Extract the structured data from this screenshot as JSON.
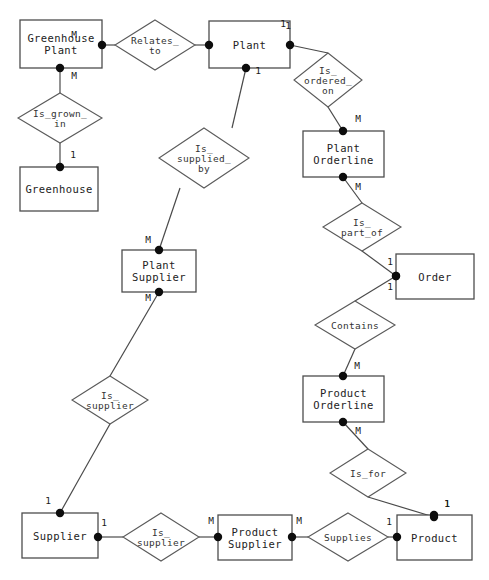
{
  "diagram": {
    "width": 489,
    "height": 580,
    "notation": "Chen",
    "colors": {
      "background": "#ffffff",
      "entity_stroke": "#4d4d4d",
      "relationship_stroke": "#5a5a5a",
      "line": "#4a4a4a",
      "dot": "#0d0d0d",
      "text": "#222222"
    }
  },
  "entities": [
    {
      "id": "greenhouse_plant",
      "label": "Greenhouse\nPlant",
      "lines": [
        "Greenhouse",
        "Plant"
      ],
      "x": 20,
      "y": 20,
      "w": 82,
      "h": 48
    },
    {
      "id": "plant",
      "label": "Plant",
      "lines": [
        "Plant"
      ],
      "x": 209,
      "y": 21,
      "w": 81,
      "h": 47
    },
    {
      "id": "greenhouse",
      "label": "Greenhouse",
      "lines": [
        "Greenhouse"
      ],
      "x": 20,
      "y": 167,
      "w": 78,
      "h": 44
    },
    {
      "id": "plant_orderline",
      "label": "Plant\nOrderline",
      "lines": [
        "Plant",
        "Orderline"
      ],
      "x": 303,
      "y": 131,
      "w": 81,
      "h": 46
    },
    {
      "id": "plant_supplier",
      "label": "Plant\nSupplier",
      "lines": [
        "Plant",
        "Supplier"
      ],
      "x": 122,
      "y": 250,
      "w": 74,
      "h": 42
    },
    {
      "id": "order",
      "label": "Order",
      "lines": [
        "Order"
      ],
      "x": 396,
      "y": 254,
      "w": 78,
      "h": 45
    },
    {
      "id": "product_orderline",
      "label": "Product\nOrderline",
      "lines": [
        "Product",
        "Orderline"
      ],
      "x": 303,
      "y": 376,
      "w": 81,
      "h": 46
    },
    {
      "id": "supplier",
      "label": "Supplier",
      "lines": [
        "Supplier"
      ],
      "x": 22,
      "y": 513,
      "w": 76,
      "h": 45
    },
    {
      "id": "product_supplier",
      "label": "Product\nSupplier",
      "lines": [
        "Product",
        "Supplier"
      ],
      "x": 218,
      "y": 515,
      "w": 74,
      "h": 45
    },
    {
      "id": "product",
      "label": "Product",
      "lines": [
        "Product"
      ],
      "x": 397,
      "y": 515,
      "w": 75,
      "h": 45
    }
  ],
  "relationships": [
    {
      "id": "relates_to",
      "label": "Relates_to",
      "lines": [
        "Relates_",
        "to"
      ],
      "cx": 155,
      "cy": 45,
      "rx": 40,
      "ry": 25
    },
    {
      "id": "is_grown_in",
      "label": "Is_grown_in",
      "lines": [
        "Is_grown_",
        "in"
      ],
      "cx": 60,
      "cy": 118,
      "rx": 42,
      "ry": 25
    },
    {
      "id": "is_supplied_by",
      "label": "Is_supplied_by",
      "lines": [
        "Is_",
        "supplied_",
        "by"
      ],
      "cx": 204,
      "cy": 158,
      "rx": 45,
      "ry": 30
    },
    {
      "id": "is_ordered_on",
      "label": "Is_ordered_on",
      "lines": [
        "Is_",
        "ordered_",
        "on"
      ],
      "cx": 328,
      "cy": 80,
      "rx": 34,
      "ry": 27
    },
    {
      "id": "is_part_of",
      "label": "Is_part_of",
      "lines": [
        "Is_",
        "part_of"
      ],
      "cx": 362,
      "cy": 227,
      "rx": 39,
      "ry": 24
    },
    {
      "id": "contains",
      "label": "Contains",
      "lines": [
        "Contains"
      ],
      "cx": 355,
      "cy": 325,
      "rx": 40,
      "ry": 24
    },
    {
      "id": "is_supplier_plant",
      "label": "Is_supplier",
      "lines": [
        "Is_",
        "supplier"
      ],
      "cx": 110,
      "cy": 400,
      "rx": 38,
      "ry": 24
    },
    {
      "id": "is_for",
      "label": "Is_for",
      "lines": [
        "Is_for"
      ],
      "cx": 368,
      "cy": 473,
      "rx": 38,
      "ry": 24
    },
    {
      "id": "is_supplier_product",
      "label": "Is_supplier",
      "lines": [
        "Is_",
        "supplier"
      ],
      "cx": 161,
      "cy": 537,
      "rx": 38,
      "ry": 24
    },
    {
      "id": "supplies",
      "label": "Supplies",
      "lines": [
        "Supplies"
      ],
      "cx": 348,
      "cy": 537,
      "rx": 40,
      "ry": 24
    }
  ],
  "connections": [
    {
      "id": "c-ghplant-relates",
      "from": "greenhouse_plant",
      "to": "relates_to",
      "points": [
        [
          102,
          45
        ],
        [
          115,
          45
        ]
      ],
      "dot": [
        102,
        45
      ],
      "cardinality": "M",
      "cardinality_pos": [
        74,
        38
      ]
    },
    {
      "id": "c-relates-plant",
      "from": "relates_to",
      "to": "plant",
      "points": [
        [
          195,
          45
        ],
        [
          209,
          45
        ]
      ],
      "dot": [
        209,
        45
      ],
      "cardinality": "1",
      "cardinality_pos": [
        283,
        27
      ]
    },
    {
      "id": "c-ghplant-grown",
      "from": "greenhouse_plant",
      "to": "is_grown_in",
      "points": [
        [
          60,
          68
        ],
        [
          60,
          93
        ]
      ],
      "dot": [
        60,
        68
      ],
      "cardinality": "M",
      "cardinality_pos": [
        74,
        79
      ]
    },
    {
      "id": "c-grown-greenhouse",
      "from": "is_grown_in",
      "to": "greenhouse",
      "points": [
        [
          60,
          143
        ],
        [
          60,
          167
        ]
      ],
      "dot": [
        60,
        167
      ],
      "cardinality": "1",
      "cardinality_pos": [
        73,
        158
      ]
    },
    {
      "id": "c-plant-supplied",
      "from": "plant",
      "to": "is_supplied_by",
      "points": [
        [
          246,
          68
        ],
        [
          232,
          128
        ]
      ],
      "dot": [
        246,
        68
      ],
      "cardinality": "1",
      "cardinality_pos": [
        258,
        74
      ]
    },
    {
      "id": "c-supplied-plantsupplier",
      "from": "is_supplied_by",
      "to": "plant_supplier",
      "points": [
        [
          180,
          188
        ],
        [
          159,
          250
        ]
      ],
      "dot": [
        159,
        250
      ],
      "cardinality": "M",
      "cardinality_pos": [
        148,
        243
      ]
    },
    {
      "id": "c-plant-ordered",
      "from": "plant",
      "to": "is_ordered_on",
      "points": [
        [
          290,
          45
        ],
        [
          328,
          53
        ]
      ],
      "dot": [
        290,
        45
      ],
      "cardinality": "1",
      "cardinality_pos": [
        288,
        29
      ]
    },
    {
      "id": "c-ordered-plantorderline",
      "from": "is_ordered_on",
      "to": "plant_orderline",
      "points": [
        [
          328,
          107
        ],
        [
          343,
          131
        ]
      ],
      "dot": [
        343,
        131
      ],
      "cardinality": "M",
      "cardinality_pos": [
        358,
        122
      ]
    },
    {
      "id": "c-plantorderline-partof",
      "from": "plant_orderline",
      "to": "is_part_of",
      "points": [
        [
          343,
          177
        ],
        [
          362,
          203
        ]
      ],
      "dot": [
        343,
        177
      ],
      "cardinality": "M",
      "cardinality_pos": [
        358,
        190
      ]
    },
    {
      "id": "c-partof-order",
      "from": "is_part_of",
      "to": "order",
      "points": [
        [
          362,
          251
        ],
        [
          396,
          276
        ]
      ],
      "dot": [
        396,
        276
      ],
      "cardinality": "1",
      "cardinality_pos": [
        390,
        265
      ]
    },
    {
      "id": "c-order-contains",
      "from": "order",
      "to": "contains",
      "points": [
        [
          396,
          276
        ],
        [
          355,
          301
        ]
      ],
      "dot": [
        396,
        276
      ],
      "cardinality": "1",
      "cardinality_pos": [
        390,
        290
      ]
    },
    {
      "id": "c-contains-productorderline",
      "from": "contains",
      "to": "product_orderline",
      "points": [
        [
          355,
          349
        ],
        [
          343,
          376
        ]
      ],
      "dot": [
        343,
        376
      ],
      "cardinality": "M",
      "cardinality_pos": [
        357,
        369
      ]
    },
    {
      "id": "c-productorderline-isfor",
      "from": "product_orderline",
      "to": "is_for",
      "points": [
        [
          343,
          422
        ],
        [
          368,
          449
        ]
      ],
      "dot": [
        343,
        422
      ],
      "cardinality": "M",
      "cardinality_pos": [
        358,
        434
      ]
    },
    {
      "id": "c-isfor-product",
      "from": "is_for",
      "to": "product",
      "points": [
        [
          368,
          497
        ],
        [
          434,
          517
        ]
      ],
      "dot": [
        434,
        517
      ],
      "cardinality": "1",
      "cardinality_pos": [
        447,
        507
      ]
    },
    {
      "id": "c-plantsupplier-issupplier",
      "from": "plant_supplier",
      "to": "is_supplier_plant",
      "points": [
        [
          159,
          292
        ],
        [
          110,
          376
        ]
      ],
      "dot": [
        159,
        292
      ],
      "cardinality": "M",
      "cardinality_pos": [
        148,
        301
      ]
    },
    {
      "id": "c-issupplier-supplier",
      "from": "is_supplier_plant",
      "to": "supplier",
      "points": [
        [
          110,
          424
        ],
        [
          60,
          513
        ]
      ],
      "dot": [
        60,
        513
      ],
      "cardinality": "1",
      "cardinality_pos": [
        48,
        504
      ]
    },
    {
      "id": "c-supplier-issupplier2",
      "from": "supplier",
      "to": "is_supplier_product",
      "points": [
        [
          98,
          537
        ],
        [
          123,
          537
        ]
      ],
      "dot": [
        98,
        537
      ],
      "cardinality": "1",
      "cardinality_pos": [
        104,
        526
      ]
    },
    {
      "id": "c-issupplier2-productsupplier",
      "from": "is_supplier_product",
      "to": "product_supplier",
      "points": [
        [
          199,
          537
        ],
        [
          218,
          537
        ]
      ],
      "dot": [
        218,
        537
      ],
      "cardinality": "M",
      "cardinality_pos": [
        211,
        524
      ]
    },
    {
      "id": "c-productsupplier-supplies",
      "from": "product_supplier",
      "to": "supplies",
      "points": [
        [
          292,
          537
        ],
        [
          308,
          537
        ]
      ],
      "dot": [
        292,
        537
      ],
      "cardinality": "M",
      "cardinality_pos": [
        299,
        524
      ]
    },
    {
      "id": "c-supplies-product",
      "from": "supplies",
      "to": "product",
      "points": [
        [
          388,
          537
        ],
        [
          397,
          537
        ]
      ],
      "dot": [
        397,
        537
      ],
      "cardinality": "1",
      "cardinality_pos": [
        389,
        525
      ]
    },
    {
      "id": "c-product-top-dot",
      "from": "product",
      "to": "is_for",
      "points": [
        [
          434,
          515
        ],
        [
          434,
          515
        ]
      ],
      "dot": [
        434,
        515
      ],
      "cardinality": "1",
      "cardinality_pos": [
        447,
        507
      ]
    }
  ]
}
